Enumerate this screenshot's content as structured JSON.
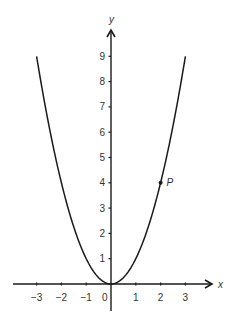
{
  "chart_data": {
    "type": "line",
    "title": "",
    "xlabel": "x",
    "ylabel": "y",
    "function": "y = x^2",
    "x": [
      -3,
      -2.5,
      -2,
      -1.5,
      -1,
      -0.5,
      0,
      0.5,
      1,
      1.5,
      2,
      2.5,
      3
    ],
    "series": [
      {
        "name": "y = x^2",
        "values": [
          9,
          6.25,
          4,
          2.25,
          1,
          0.25,
          0,
          0.25,
          1,
          2.25,
          4,
          6.25,
          9
        ]
      }
    ],
    "xlim": [
      -4,
      4
    ],
    "ylim": [
      -1,
      10
    ],
    "x_ticks": [
      -3,
      -2,
      -1,
      1,
      2,
      3
    ],
    "x_tick_labels": [
      "−3",
      "−2",
      "−1",
      "1",
      "2",
      "3"
    ],
    "y_ticks": [
      1,
      2,
      3,
      4,
      5,
      6,
      7,
      8,
      9
    ],
    "y_tick_labels": [
      "1",
      "2",
      "3",
      "4",
      "5",
      "6",
      "7",
      "8",
      "9"
    ],
    "origin_label": "0",
    "grid": false,
    "legend": null,
    "annotations": [
      {
        "label": "P",
        "x": 2,
        "y": 4,
        "marker": "dot"
      }
    ]
  },
  "colors": {
    "axis": "#1a1a1a",
    "curve": "#1a1a1a",
    "text": "#333333",
    "background": "#ffffff"
  }
}
